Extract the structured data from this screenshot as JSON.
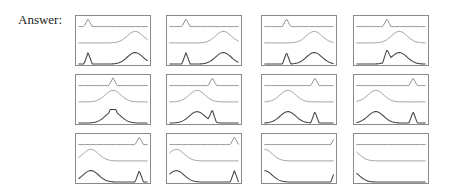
{
  "label": "Answer:",
  "layout": {
    "rows": 3,
    "cols": 4,
    "col_x": [
      75,
      166,
      261,
      353
    ],
    "row_y": [
      15,
      74,
      133
    ],
    "panel_w": 76,
    "panel_h": 51
  },
  "colors": {
    "border": "#8a8a8a",
    "line_top": "#888888",
    "line_mid": "#999999",
    "line_bottom": "#444444"
  },
  "panels": [
    {
      "spike": 0.14,
      "bump": 0.82
    },
    {
      "spike": 0.24,
      "bump": 0.78
    },
    {
      "spike": 0.32,
      "bump": 0.72
    },
    {
      "spike": 0.44,
      "bump": 0.62
    },
    {
      "spike": 0.5,
      "bump": 0.5
    },
    {
      "spike": 0.62,
      "bump": 0.4
    },
    {
      "spike": 0.73,
      "bump": 0.34
    },
    {
      "spike": 0.82,
      "bump": 0.28
    },
    {
      "spike": 0.88,
      "bump": 0.18
    },
    {
      "spike": 0.94,
      "bump": 0.1
    },
    {
      "spike": 1.02,
      "bump": 0.0
    },
    {
      "spike": 1.2,
      "bump": -0.08
    }
  ]
}
